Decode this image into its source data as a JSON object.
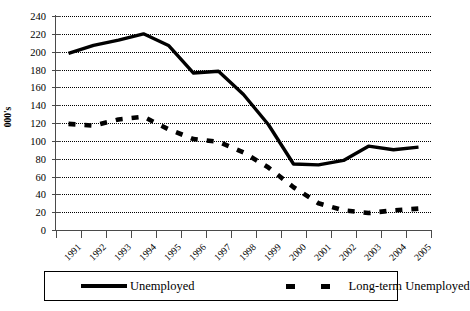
{
  "chart_data": {
    "type": "line",
    "title": "",
    "xlabel": "",
    "ylabel": "000's",
    "ylim": [
      0,
      240
    ],
    "ytick_step": 20,
    "yticks": [
      240,
      220,
      200,
      180,
      160,
      140,
      120,
      100,
      80,
      60,
      40,
      20,
      0
    ],
    "grid": true,
    "grid_style": "dotted-horizontal",
    "legend_position": "bottom",
    "categories": [
      "1991",
      "1992",
      "1993",
      "1994",
      "1995",
      "1996",
      "1997",
      "1998",
      "1999",
      "2000",
      "2001",
      "2002",
      "2003",
      "2004",
      "2005"
    ],
    "series": [
      {
        "name": "Unemployed",
        "style": "solid",
        "color": "#000000",
        "values": [
          198,
          207,
          213,
          220,
          207,
          176,
          178,
          152,
          118,
          74,
          73,
          78,
          94,
          90,
          93
        ]
      },
      {
        "name": "Long-term Unemployed",
        "style": "dashed",
        "color": "#000000",
        "values": [
          119,
          117,
          124,
          127,
          113,
          102,
          99,
          87,
          70,
          48,
          30,
          22,
          19,
          22,
          24
        ]
      }
    ]
  },
  "legend": {
    "entries": [
      {
        "label": "Unemployed",
        "marker": "solid-line-swatch"
      },
      {
        "label": "Long-term Unemployed",
        "marker": "dashed-line-swatch"
      }
    ]
  },
  "axes": {
    "y_title": "000's"
  }
}
